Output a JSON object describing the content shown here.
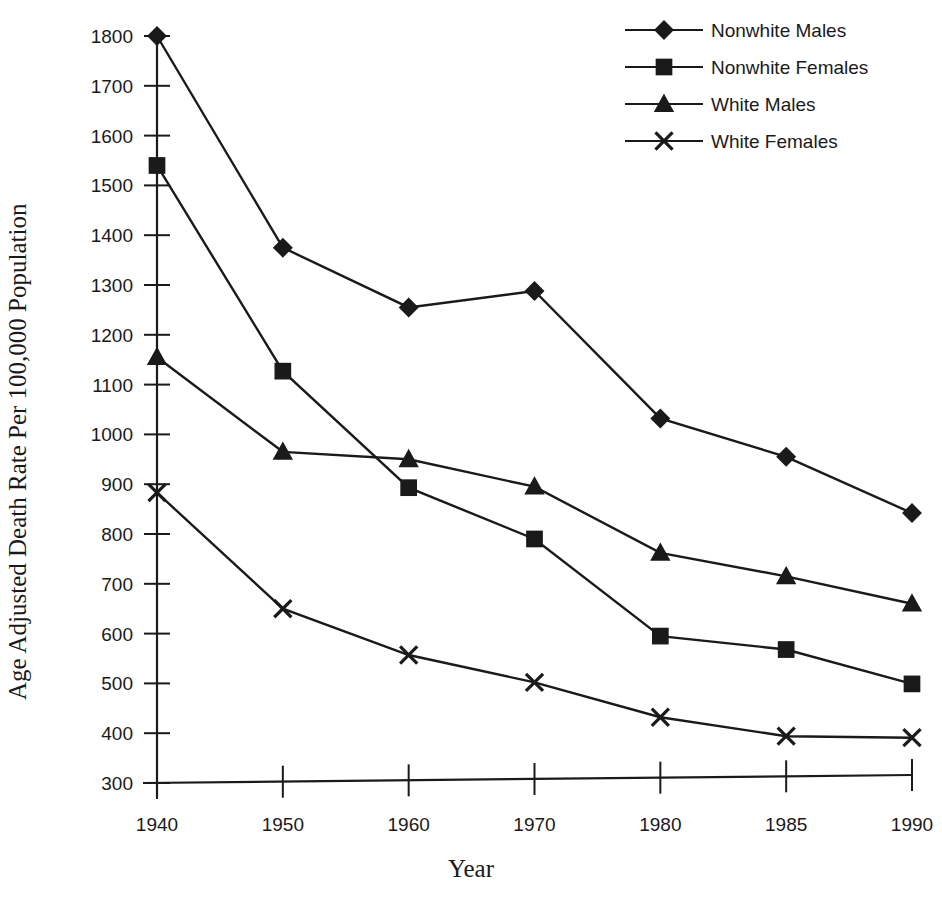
{
  "chart_data": {
    "type": "line",
    "title": "",
    "xlabel": "Year",
    "ylabel": "Age Adjusted Death Rate Per 100,000 Population",
    "categories": [
      "1940",
      "1950",
      "1960",
      "1970",
      "1980",
      "1985",
      "1990"
    ],
    "xtick_labels": [
      "1940",
      "1950",
      "1960",
      "1970",
      "1980",
      "1985",
      "1990"
    ],
    "ytick_labels": [
      "300",
      "400",
      "500",
      "600",
      "700",
      "800",
      "900",
      "1000",
      "1100",
      "1200",
      "1300",
      "1400",
      "1500",
      "1600",
      "1700",
      "1800"
    ],
    "ylim": [
      300,
      1800
    ],
    "ytick_step": 100,
    "grid": false,
    "legend_position": "top-right",
    "series": [
      {
        "name": "Nonwhite Males",
        "marker": "diamond",
        "color": "#1a1a1a",
        "values": [
          1800,
          1375,
          1255,
          1288,
          1032,
          955,
          842
        ]
      },
      {
        "name": "Nonwhite Females",
        "marker": "square",
        "color": "#1a1a1a",
        "values": [
          1540,
          1127,
          893,
          790,
          595,
          568,
          499
        ]
      },
      {
        "name": "White Males",
        "marker": "triangle",
        "color": "#1a1a1a",
        "values": [
          1155,
          965,
          950,
          895,
          762,
          715,
          660
        ]
      },
      {
        "name": "White Females",
        "marker": "x",
        "color": "#1a1a1a",
        "values": [
          883,
          650,
          557,
          502,
          432,
          394,
          391
        ]
      }
    ]
  },
  "legend": {
    "items": [
      {
        "label": "Nonwhite Males",
        "marker": "diamond"
      },
      {
        "label": "Nonwhite Females",
        "marker": "square"
      },
      {
        "label": "White Males",
        "marker": "triangle"
      },
      {
        "label": "White Females",
        "marker": "x"
      }
    ]
  },
  "axes": {
    "y_title": "Age Adjusted Death Rate Per 100,000 Population",
    "x_title": "Year"
  },
  "colors": {
    "ink": "#1a1a1a",
    "background": "#ffffff"
  }
}
